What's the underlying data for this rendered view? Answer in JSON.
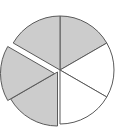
{
  "figure": {
    "name": "pie-chart",
    "type": "pie",
    "title": "",
    "background_color": "#ffffff",
    "stroke_color": "#5a5a5a",
    "stroke_width": 1,
    "center": {
      "x": 60,
      "y": 70
    },
    "radius": 54,
    "start_angle_deg": -90,
    "direction": "clockwise"
  },
  "chart_data": {
    "type": "pie",
    "title": "",
    "subtitle": "",
    "xlabel": "",
    "ylabel": "",
    "legend": "none",
    "grid": false,
    "labels": [
      "",
      "",
      "",
      "",
      "",
      ""
    ],
    "categories": [
      "slice-1",
      "slice-2",
      "slice-3",
      "slice-4",
      "slice-5",
      "slice-6"
    ],
    "values": [
      1,
      1,
      1,
      1,
      1,
      1
    ],
    "percentages": [
      16.67,
      16.67,
      16.67,
      16.67,
      16.67,
      16.67
    ],
    "angles_deg": [
      60,
      60,
      60,
      60,
      60,
      60
    ],
    "colors": [
      "#cccccc",
      "#ffffff",
      "#ffffff",
      "#cccccc",
      "#cccccc",
      "#cccccc"
    ],
    "exploded": [
      false,
      false,
      false,
      true,
      true,
      false
    ],
    "explode_offset_px": [
      0,
      0,
      0,
      4,
      8,
      0
    ],
    "explode_direction_deg": [
      0,
      0,
      0,
      120,
      180,
      0
    ],
    "annotations": []
  },
  "slices": [
    {
      "name": "slice-top-right",
      "start_deg": -90,
      "end_deg": -30,
      "fill": "#cccccc",
      "offset_x": 0,
      "offset_y": 0
    },
    {
      "name": "slice-right",
      "start_deg": -30,
      "end_deg": 30,
      "fill": "#ffffff",
      "offset_x": 0,
      "offset_y": 0
    },
    {
      "name": "slice-bottom-right",
      "start_deg": 30,
      "end_deg": 90,
      "fill": "#ffffff",
      "offset_x": 0,
      "offset_y": 0
    },
    {
      "name": "slice-bottom-left-exploded",
      "start_deg": 90,
      "end_deg": 150,
      "fill": "#cccccc",
      "offset_x": -2.5,
      "offset_y": 2.0
    },
    {
      "name": "slice-left-exploded",
      "start_deg": 150,
      "end_deg": 210,
      "fill": "#cccccc",
      "offset_x": -5.5,
      "offset_y": 3.5
    },
    {
      "name": "slice-top-left",
      "start_deg": 210,
      "end_deg": 270,
      "fill": "#cccccc",
      "offset_x": 0,
      "offset_y": 0
    }
  ]
}
